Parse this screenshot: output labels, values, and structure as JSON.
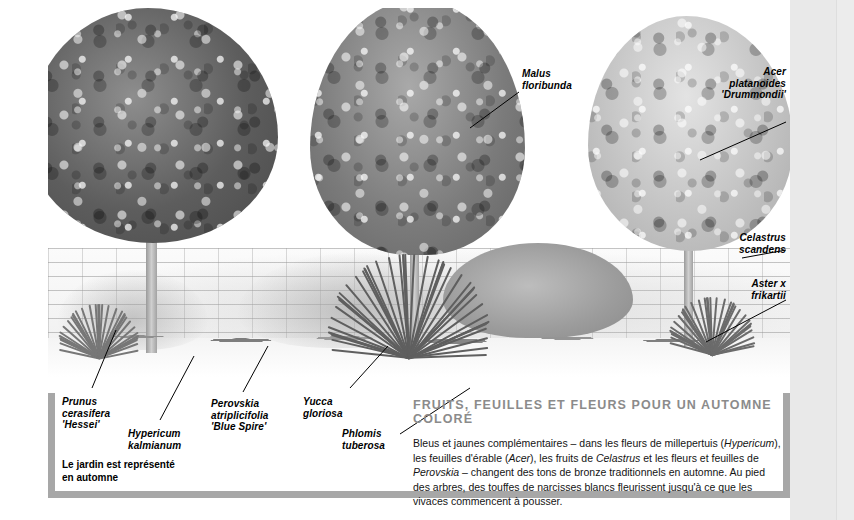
{
  "page": {
    "background_color": "#ffffff",
    "margin_color": "#e9e9e9",
    "frame_color": "#a7a7a7"
  },
  "illustration": {
    "name": "garden-border-autumn-illustration",
    "description": "Pen-and-wash style garden border illustration in greyscale: three trees above a brick wall with a mixed planting border in front",
    "elements": [
      "dark-tree-left",
      "mid-tone-tree-centre",
      "light-tree-right",
      "brick-wall",
      "planting-border",
      "yucca-clump",
      "grass-tufts",
      "lawn"
    ]
  },
  "labels": [
    {
      "id": "malus",
      "lines": [
        "Malus",
        "floribunda"
      ],
      "align": "left"
    },
    {
      "id": "acer",
      "lines": [
        "Acer",
        "platanoides",
        "'Drummondii'"
      ],
      "align": "right"
    },
    {
      "id": "celastrus",
      "lines": [
        "Celastrus",
        "scandens"
      ],
      "align": "right"
    },
    {
      "id": "aster",
      "lines": [
        "Aster x",
        "frikartii"
      ],
      "align": "right"
    },
    {
      "id": "prunus",
      "lines": [
        "Prunus",
        "cerasifera",
        "'Hessei'"
      ],
      "align": "left"
    },
    {
      "id": "hypericum",
      "lines": [
        "Hypericum",
        "kalmianum"
      ],
      "align": "left"
    },
    {
      "id": "perovskia",
      "lines": [
        "Perovskia",
        "atriplicifolia",
        "'Blue Spire'"
      ],
      "align": "left"
    },
    {
      "id": "yucca",
      "lines": [
        "Yucca",
        "gloriosa"
      ],
      "align": "left"
    },
    {
      "id": "phlomis",
      "lines": [
        "Phlomis",
        "tuberosa"
      ],
      "align": "left"
    }
  ],
  "footnote": {
    "line1": "Le jardin est représenté",
    "line2": "en automne"
  },
  "caption": {
    "title": "FRUITS, FEUILLES ET FLEURS POUR UN AUTOMNE COLORÉ",
    "title_color": "#8b8b8b",
    "body_line1_a": "Bleus et jaunes complémentaires – dans les fleurs de millepertuis (",
    "body_line1_em": "Hypericum",
    "body_line1_b": "),",
    "body_line2_a": "les feuilles d'érable (",
    "body_line2_em1": "Acer",
    "body_line2_b": "), les fruits de ",
    "body_line2_em2": "Celastrus",
    "body_line2_c": " et les fleurs et feuilles de ",
    "body_line2_em3": "Perovskia",
    "body_line2_d": " –",
    "body_line3": "changent des tons de bronze traditionnels en automne. Au pied des arbres, des touffes",
    "body_line4": "de narcisses blancs fleurissent jusqu'à ce que les vivaces commencent à pousser."
  }
}
